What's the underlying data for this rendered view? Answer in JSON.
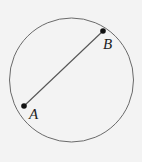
{
  "diagram": {
    "type": "circle-with-chord",
    "circle": {
      "cx": 71.5,
      "cy": 80,
      "r": 62,
      "stroke": "#6a6a6a",
      "stroke_width": 1
    },
    "chord": {
      "from": "A",
      "to": "B",
      "stroke": "#555555",
      "stroke_width": 1.1
    },
    "points": [
      {
        "id": "A",
        "label": "A",
        "x": 24,
        "y": 106,
        "label_x": 29,
        "label_y": 107
      },
      {
        "id": "B",
        "label": "B",
        "x": 103,
        "y": 31,
        "label_x": 103,
        "label_y": 37
      }
    ],
    "point_color": "#111111",
    "background": "#f3f3f3"
  }
}
